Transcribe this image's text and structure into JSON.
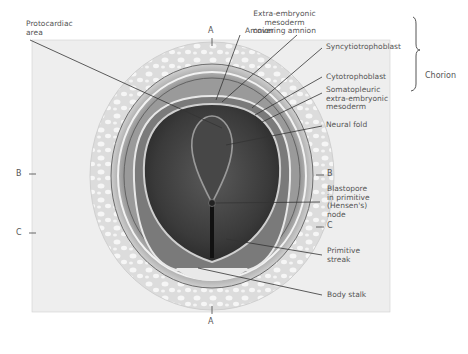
{
  "figure": {
    "section_markers": {
      "top_A": "A",
      "bottom_A": "A",
      "left_B": "B",
      "left_C": "C",
      "right_B": "B",
      "right_C": "C"
    },
    "labels": {
      "protocardiac_area": "Protocardiac\narea",
      "amnion": "Amnion",
      "extra_embryonic_mesoderm_amnion": "Extra-embryonic\nmesoderm\ncovering amnion",
      "syncytiotrophoblast": "Syncytiotrophoblast",
      "cytotrophoblast": "Cytotrophoblast",
      "somatopleuric_mesoderm": "Somatopleuric\nextra-embryonic\nmesoderm",
      "chorion": "Chorion",
      "neural_fold": "Neural fold",
      "blastopore": "Blastopore\nin primitive\n(Hensen's)\nnode",
      "primitive_streak": "Primitive\nstreak",
      "body_stalk": "Body stalk"
    },
    "colors": {
      "background": "#ffffff",
      "frame_fill": "#ececec",
      "trophoblast_lace": "#d8d8d8",
      "chorion_ring": "#9a9a9a",
      "amnion_cavity": "#7a7a7a",
      "embryonic_disc": "#3e3e3e",
      "leader_line": "#333333",
      "text": "#555555"
    }
  }
}
